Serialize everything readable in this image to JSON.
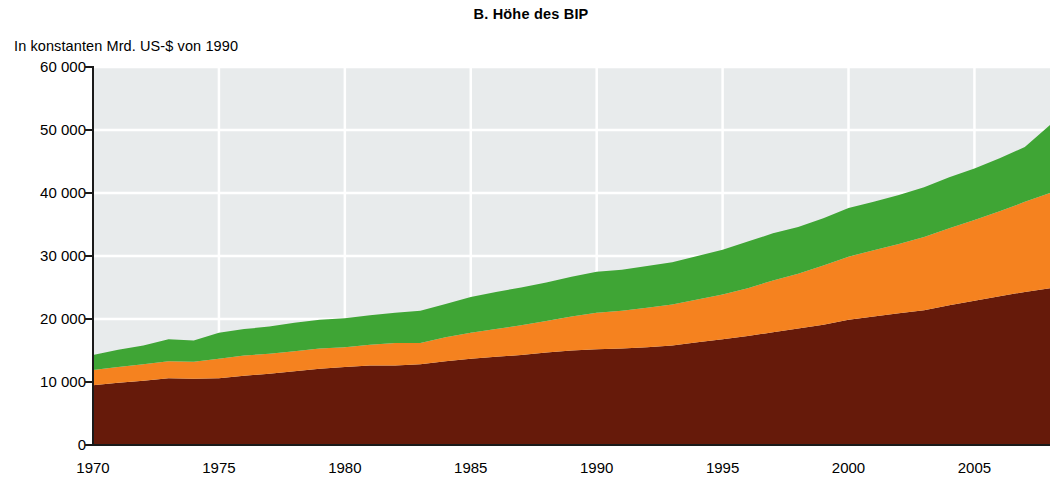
{
  "chart_title": "B. Höhe des BIP",
  "y_axis_title": "In konstanten Mrd. US-$ von 1990",
  "palette": {
    "plot_background": "#E8EBEC",
    "gridline": "#FFFFFF",
    "axis": "#1A1A1A",
    "page_background": "#FFFFFF",
    "series_brown": "#661A0A",
    "series_orange": "#F5821F",
    "series_green": "#3FA535"
  },
  "chart_data": {
    "type": "area",
    "stacked": true,
    "title": "B. Höhe des BIP",
    "subtitle": "",
    "xlabel": "",
    "ylabel": "In konstanten Mrd. US-$ von 1990",
    "xlim": [
      1970,
      2008
    ],
    "ylim": [
      0,
      60000
    ],
    "grid": true,
    "legend_position": "none",
    "y_ticks": [
      0,
      10000,
      20000,
      30000,
      40000,
      50000,
      60000
    ],
    "y_tick_labels": [
      "0",
      "10 000",
      "20 000",
      "30 000",
      "40 000",
      "50 000",
      "60 000"
    ],
    "x_ticks": [
      1970,
      1975,
      1980,
      1985,
      1990,
      1995,
      2000,
      2005
    ],
    "x_tick_labels": [
      "1970",
      "1975",
      "1980",
      "1985",
      "1990",
      "1995",
      "2000",
      "2005"
    ],
    "x": [
      1970,
      1971,
      1972,
      1973,
      1974,
      1975,
      1976,
      1977,
      1978,
      1979,
      1980,
      1981,
      1982,
      1983,
      1984,
      1985,
      1986,
      1987,
      1988,
      1989,
      1990,
      1991,
      1992,
      1993,
      1994,
      1995,
      1996,
      1997,
      1998,
      1999,
      2000,
      2001,
      2002,
      2003,
      2004,
      2005,
      2006,
      2007,
      2008
    ],
    "series": [
      {
        "name": "series-brown",
        "color": "#661A0A",
        "values": [
          9500,
          9900,
          10200,
          10600,
          10500,
          10600,
          11000,
          11300,
          11700,
          12100,
          12400,
          12600,
          12600,
          12800,
          13300,
          13700,
          14000,
          14300,
          14700,
          15000,
          15200,
          15300,
          15500,
          15800,
          16300,
          16800,
          17300,
          17900,
          18500,
          19100,
          19900,
          20400,
          20900,
          21400,
          22200,
          22900,
          23600,
          24300,
          24900
        ]
      },
      {
        "name": "series-orange",
        "color": "#F5821F",
        "values": [
          2400,
          2500,
          2600,
          2700,
          2700,
          3100,
          3200,
          3200,
          3200,
          3200,
          3100,
          3300,
          3600,
          3400,
          3800,
          4100,
          4400,
          4700,
          5000,
          5400,
          5800,
          6000,
          6300,
          6500,
          6800,
          7100,
          7600,
          8200,
          8700,
          9400,
          10000,
          10500,
          11000,
          11600,
          12200,
          12800,
          13500,
          14300,
          15100
        ]
      },
      {
        "name": "series-green",
        "color": "#3FA535",
        "values": [
          2400,
          2700,
          3000,
          3500,
          3400,
          4100,
          4200,
          4300,
          4500,
          4600,
          4600,
          4700,
          4800,
          5100,
          5300,
          5700,
          5900,
          6000,
          6100,
          6300,
          6500,
          6500,
          6600,
          6700,
          6900,
          7100,
          7400,
          7500,
          7400,
          7500,
          7700,
          7700,
          7800,
          7900,
          8100,
          8200,
          8400,
          8700,
          10800
        ]
      }
    ]
  }
}
